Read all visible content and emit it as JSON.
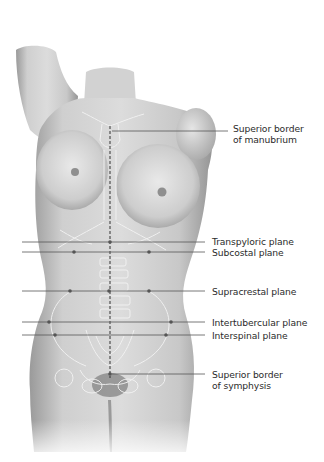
{
  "figure": {
    "colors": {
      "skin_light": "#e6e6e6",
      "skin_mid": "#bdbdbd",
      "skin_dark": "#8e8e8e",
      "bone_outline": "#f4f4f4",
      "leader_line": "#555555",
      "midline": "#333333",
      "label_text": "#2b2b2b"
    },
    "labels": [
      {
        "id": "manubrium",
        "line1": "Superior border",
        "line2": "of manubrium",
        "y": 131
      },
      {
        "id": "transpyloric",
        "line1": "Transpyloric plane",
        "y": 242
      },
      {
        "id": "subcostal",
        "line1": "Subcostal plane",
        "y": 252
      },
      {
        "id": "supracrestal",
        "line1": "Supracrestal plane",
        "y": 291
      },
      {
        "id": "intertubercular",
        "line1": "Intertubercular plane",
        "y": 322
      },
      {
        "id": "interspinal",
        "line1": "Interspinal plane",
        "y": 335
      },
      {
        "id": "symphysis",
        "line1": "Superior border",
        "line2": "of symphysis",
        "y": 374
      }
    ]
  }
}
